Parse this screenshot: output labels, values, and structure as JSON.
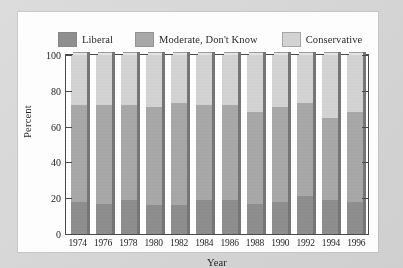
{
  "chart_data": {
    "type": "bar",
    "subtype": "stacked-bar-100",
    "title": "",
    "xlabel": "Year",
    "ylabel": "Percent",
    "ylim": [
      0,
      100
    ],
    "yticks": [
      0,
      20,
      40,
      60,
      80,
      100
    ],
    "grid": false,
    "legend_position": "top",
    "categories": [
      "1974",
      "1976",
      "1978",
      "1980",
      "1982",
      "1984",
      "1986",
      "1988",
      "1990",
      "1992",
      "1994",
      "1996"
    ],
    "series": [
      {
        "name": "Liberal",
        "color": "#8e8e8e",
        "values": [
          18,
          17,
          19,
          16,
          16,
          19,
          19,
          17,
          18,
          21,
          19,
          18
        ]
      },
      {
        "name": "Moderate, Don't Know",
        "color": "#a8a8a8",
        "values": [
          54,
          55,
          53,
          55,
          57,
          53,
          53,
          51,
          53,
          52,
          46,
          50
        ]
      },
      {
        "name": "Conservative",
        "color": "#d3d3d3",
        "values": [
          28,
          28,
          28,
          29,
          27,
          28,
          28,
          32,
          29,
          27,
          35,
          32
        ]
      }
    ],
    "cumulative_tops": {
      "liberal_top": [
        18,
        17,
        19,
        16,
        16,
        19,
        19,
        17,
        18,
        21,
        19,
        18
      ],
      "moderate_top": [
        72,
        72,
        72,
        71,
        73,
        72,
        72,
        68,
        71,
        73,
        65,
        68
      ],
      "conservative_top": [
        100,
        100,
        100,
        100,
        100,
        100,
        100,
        100,
        100,
        100,
        100,
        100
      ]
    }
  },
  "legend": {
    "entries": [
      {
        "label": "Liberal",
        "color": "#8e8e8e"
      },
      {
        "label": "Moderate, Don't Know",
        "color": "#a8a8a8"
      },
      {
        "label": "Conservative",
        "color": "#d3d3d3"
      }
    ]
  },
  "axes": {
    "y_title": "Percent",
    "x_title": "Year",
    "y_tick_labels": [
      "100",
      "80",
      "60",
      "40",
      "20",
      "0"
    ],
    "x_tick_labels": [
      "1974",
      "1976",
      "1978",
      "1980",
      "1982",
      "1984",
      "1986",
      "1988",
      "1990",
      "1992",
      "1994",
      "1996"
    ]
  }
}
